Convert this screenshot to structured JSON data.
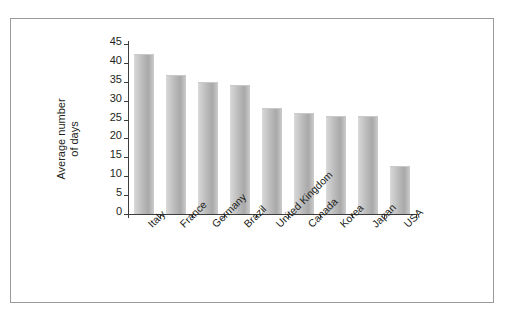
{
  "chart_data": {
    "type": "bar",
    "title": "",
    "subtitle": "",
    "xlabel": "",
    "ylabel": "Average number of days",
    "ylabel_lines": [
      "Average number",
      "of days"
    ],
    "categories": [
      "Italy",
      "France",
      "Germany",
      "Brazil",
      "United Kingdom",
      "Canada",
      "Korea",
      "Japan",
      "USA"
    ],
    "values": [
      42,
      36.5,
      34.7,
      34,
      27.8,
      26.4,
      25.8,
      25.8,
      12.5
    ],
    "ylim": [
      0,
      45
    ],
    "ytick_values": [
      0,
      5,
      10,
      15,
      20,
      25,
      30,
      35,
      40,
      45
    ],
    "ytick_labels": [
      "0",
      "5",
      "10",
      "15",
      "20",
      "25",
      "30",
      "35",
      "40",
      "45"
    ],
    "grid": false,
    "legend": null,
    "bar_color": "#b7b7b7",
    "axis_color": "#3d3d3d",
    "frame_color": "#9a9a9a",
    "background": "#ffffff",
    "label_rotation_deg": -45
  }
}
